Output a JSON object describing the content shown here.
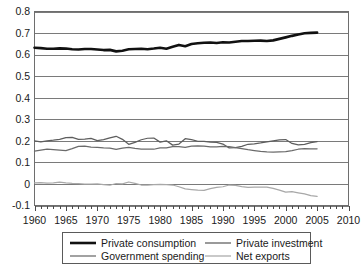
{
  "chart_data": {
    "type": "line",
    "title": "",
    "xlabel": "",
    "ylabel": "",
    "xlim": [
      1960,
      2010
    ],
    "ylim": [
      -0.1,
      0.8
    ],
    "grid": true,
    "legend_position": "bottom",
    "y_ticks": [
      "0.8",
      "0.7",
      "0.6",
      "0.5",
      "0.4",
      "0.3",
      "0.2",
      "0.1",
      "0",
      "-0.1"
    ],
    "y_tick_values": [
      0.8,
      0.7,
      0.6,
      0.5,
      0.4,
      0.3,
      0.2,
      0.1,
      0,
      -0.1
    ],
    "x_ticks": [
      "1960",
      "1965",
      "1970",
      "1975",
      "1980",
      "1985",
      "1990",
      "1995",
      "2000",
      "2005",
      "2010"
    ],
    "x_tick_values": [
      1960,
      1965,
      1970,
      1975,
      1980,
      1985,
      1990,
      1995,
      2000,
      2005,
      2010
    ],
    "x_minor_tick_step": 1,
    "x": [
      1960,
      1961,
      1962,
      1963,
      1964,
      1965,
      1966,
      1967,
      1968,
      1969,
      1970,
      1971,
      1972,
      1973,
      1974,
      1975,
      1976,
      1977,
      1978,
      1979,
      1980,
      1981,
      1982,
      1983,
      1984,
      1985,
      1986,
      1987,
      1988,
      1989,
      1990,
      1991,
      1992,
      1993,
      1994,
      1995,
      1996,
      1997,
      1998,
      1999,
      2000,
      2001,
      2002,
      2003,
      2004,
      2005
    ],
    "series": [
      {
        "name": "Private consumption",
        "color": "#111111",
        "width": 2.6,
        "values": [
          0.632,
          0.63,
          0.627,
          0.627,
          0.629,
          0.628,
          0.625,
          0.624,
          0.626,
          0.626,
          0.624,
          0.621,
          0.622,
          0.615,
          0.618,
          0.625,
          0.626,
          0.627,
          0.625,
          0.628,
          0.632,
          0.627,
          0.636,
          0.645,
          0.639,
          0.649,
          0.653,
          0.655,
          0.656,
          0.654,
          0.657,
          0.656,
          0.66,
          0.663,
          0.663,
          0.664,
          0.665,
          0.663,
          0.666,
          0.673,
          0.68,
          0.687,
          0.693,
          0.699,
          0.701,
          0.702
        ]
      },
      {
        "name": "Private investment",
        "color": "#5d5d5d",
        "width": 1.25,
        "values": [
          0.2,
          0.195,
          0.2,
          0.203,
          0.207,
          0.215,
          0.216,
          0.207,
          0.208,
          0.211,
          0.201,
          0.206,
          0.214,
          0.221,
          0.207,
          0.184,
          0.193,
          0.205,
          0.212,
          0.213,
          0.194,
          0.2,
          0.18,
          0.185,
          0.21,
          0.206,
          0.198,
          0.197,
          0.194,
          0.193,
          0.185,
          0.167,
          0.168,
          0.174,
          0.184,
          0.186,
          0.19,
          0.195,
          0.2,
          0.204,
          0.206,
          0.188,
          0.181,
          0.184,
          0.192,
          0.196
        ]
      },
      {
        "name": "Government spending",
        "color": "#6b6b6b",
        "width": 1.25,
        "values": [
          0.152,
          0.157,
          0.161,
          0.159,
          0.157,
          0.155,
          0.164,
          0.174,
          0.175,
          0.171,
          0.17,
          0.167,
          0.166,
          0.16,
          0.166,
          0.17,
          0.165,
          0.162,
          0.161,
          0.161,
          0.167,
          0.167,
          0.173,
          0.173,
          0.17,
          0.175,
          0.177,
          0.176,
          0.172,
          0.172,
          0.174,
          0.173,
          0.169,
          0.164,
          0.159,
          0.155,
          0.151,
          0.149,
          0.148,
          0.149,
          0.15,
          0.155,
          0.161,
          0.164,
          0.163,
          0.163
        ]
      },
      {
        "name": "Net exports",
        "color": "#a8a8a8",
        "width": 1.25,
        "values": [
          0.005,
          0.006,
          0.004,
          0.005,
          0.008,
          0.005,
          0.003,
          0.002,
          -0.001,
          -0.001,
          0.0,
          -0.003,
          -0.006,
          0.002,
          0.0,
          0.009,
          0.003,
          -0.005,
          -0.006,
          -0.003,
          -0.002,
          -0.003,
          -0.005,
          -0.013,
          -0.023,
          -0.026,
          -0.029,
          -0.03,
          -0.022,
          -0.016,
          -0.013,
          -0.005,
          -0.007,
          -0.012,
          -0.016,
          -0.015,
          -0.015,
          -0.015,
          -0.021,
          -0.029,
          -0.038,
          -0.036,
          -0.041,
          -0.046,
          -0.054,
          -0.058
        ]
      }
    ],
    "legend": [
      {
        "label": "Private consumption",
        "color": "#111111",
        "width": 2.6
      },
      {
        "label": "Private investment",
        "color": "#5d5d5d",
        "width": 1.25
      },
      {
        "label": "Government spending",
        "color": "#6b6b6b",
        "width": 1.25
      },
      {
        "label": "Net exports",
        "color": "#a8a8a8",
        "width": 1.25
      }
    ]
  }
}
